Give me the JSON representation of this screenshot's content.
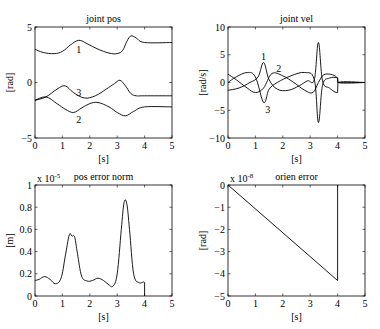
{
  "chart_data": [
    {
      "type": "line",
      "title": "joint pos",
      "xlabel": "[s]",
      "ylabel": "[rad]",
      "xlim": [
        0,
        5
      ],
      "ylim": [
        -5,
        5
      ],
      "xticks": [
        "0",
        "1",
        "2",
        "3",
        "4",
        "5"
      ],
      "yticks": [
        "-5",
        "0",
        "5"
      ],
      "grid": false,
      "series": [
        {
          "name": "1",
          "x": [
            0,
            0.3,
            0.7,
            1.0,
            1.3,
            1.6,
            1.9,
            2.3,
            2.7,
            3.0,
            3.2,
            3.35,
            3.5,
            3.7,
            4.0,
            5.0
          ],
          "y": [
            3.0,
            2.7,
            2.6,
            2.8,
            3.4,
            3.8,
            3.5,
            3.0,
            2.65,
            2.6,
            2.9,
            3.7,
            4.2,
            4.0,
            3.6,
            3.6
          ]
        },
        {
          "name": "2",
          "x": [
            0,
            0.4,
            0.8,
            1.1,
            1.4,
            1.7,
            2.0,
            2.3,
            2.7,
            3.0,
            3.3,
            3.6,
            4.0,
            5.0
          ],
          "y": [
            -1.6,
            -1.3,
            -1.9,
            -2.4,
            -2.7,
            -2.3,
            -1.9,
            -1.8,
            -2.2,
            -2.7,
            -3.0,
            -2.6,
            -2.2,
            -2.2
          ]
        },
        {
          "name": "3",
          "x": [
            0,
            0.4,
            0.8,
            1.1,
            1.4,
            1.8,
            2.2,
            2.6,
            2.9,
            3.1,
            3.3,
            3.5,
            3.7,
            4.0,
            5.0
          ],
          "y": [
            -1.6,
            -1.3,
            -0.6,
            -0.3,
            -0.9,
            -1.4,
            -1.2,
            -0.6,
            -0.1,
            0.2,
            -0.3,
            -1.0,
            -1.2,
            -1.2,
            -1.2
          ]
        }
      ],
      "annotations": [
        {
          "text": "1",
          "x": 1.6,
          "y": 3.0
        },
        {
          "text": "3",
          "x": 1.6,
          "y": -0.9
        },
        {
          "text": "2",
          "x": 1.6,
          "y": -3.3
        }
      ]
    },
    {
      "type": "line",
      "title": "joint vel",
      "xlabel": "[s]",
      "ylabel": "[rad/s]",
      "xlim": [
        0,
        5
      ],
      "ylim": [
        -10,
        10
      ],
      "xticks": [
        "0",
        "1",
        "2",
        "3",
        "4",
        "5"
      ],
      "yticks": [
        "-10",
        "-5",
        "0",
        "5",
        "10"
      ],
      "grid": false,
      "series": [
        {
          "name": "1",
          "x": [
            0,
            0.4,
            0.8,
            1.1,
            1.3,
            1.5,
            1.8,
            2.2,
            2.6,
            2.9,
            3.15,
            3.3,
            3.45,
            3.7,
            4.0,
            4.01,
            5.0
          ],
          "y": [
            -1.4,
            -1.0,
            0,
            1.0,
            3.6,
            0.5,
            -1.2,
            -1.4,
            -0.6,
            0.3,
            0.5,
            7.2,
            0.3,
            -1.0,
            -1.8,
            0,
            0
          ]
        },
        {
          "name": "2",
          "x": [
            0,
            0.3,
            0.7,
            1.0,
            1.3,
            1.6,
            2.0,
            2.4,
            2.8,
            3.1,
            3.3,
            3.5,
            3.8,
            4.0,
            4.01,
            5.0
          ],
          "y": [
            1.5,
            0.5,
            -1.0,
            -1.8,
            -1.0,
            1.6,
            1.2,
            0,
            -1.4,
            -1.8,
            0,
            1.4,
            1.4,
            0.8,
            0,
            0
          ]
        },
        {
          "name": "3",
          "x": [
            0,
            0.3,
            0.7,
            1.0,
            1.3,
            1.5,
            1.8,
            2.3,
            2.8,
            3.15,
            3.3,
            3.45,
            3.7,
            4.0,
            4.01,
            5.0
          ],
          "y": [
            0,
            1.0,
            1.8,
            1.0,
            -3.6,
            -1.2,
            0,
            1.2,
            1.8,
            0.5,
            -7.2,
            -0.5,
            0.8,
            0.8,
            0,
            0
          ]
        }
      ],
      "annotations": [
        {
          "text": "1",
          "x": 1.3,
          "y": 4.6
        },
        {
          "text": "2",
          "x": 1.85,
          "y": 2.5
        },
        {
          "text": "3",
          "x": 1.45,
          "y": -4.8
        }
      ]
    },
    {
      "type": "line",
      "title": "pos error norm",
      "xlabel": "[s]",
      "ylabel": "[m]",
      "exponent_label": "x 10^-5",
      "xlim": [
        0,
        5
      ],
      "ylim": [
        0,
        1
      ],
      "xticks": [
        "0",
        "1",
        "2",
        "3",
        "4",
        "5"
      ],
      "yticks": [
        "0",
        "0.2",
        "0.4",
        "0.6",
        "0.8",
        "1"
      ],
      "grid": false,
      "series": [
        {
          "name": "pos error norm",
          "x": [
            0,
            0.15,
            0.35,
            0.55,
            0.75,
            0.95,
            1.1,
            1.25,
            1.35,
            1.45,
            1.55,
            1.7,
            1.9,
            2.1,
            2.3,
            2.5,
            2.7,
            2.85,
            3.0,
            3.15,
            3.25,
            3.35,
            3.45,
            3.6,
            3.8,
            4.0,
            4.0
          ],
          "y": [
            0.14,
            0.15,
            0.175,
            0.15,
            0.11,
            0.16,
            0.35,
            0.55,
            0.54,
            0.53,
            0.38,
            0.18,
            0.135,
            0.14,
            0.16,
            0.14,
            0.1,
            0.09,
            0.2,
            0.6,
            0.84,
            0.83,
            0.6,
            0.2,
            0.12,
            0.12,
            0
          ]
        }
      ]
    },
    {
      "type": "line",
      "title": "orien error",
      "xlabel": "[s]",
      "ylabel": "[rad]",
      "exponent_label": "x 10^-8",
      "xlim": [
        0,
        5
      ],
      "ylim": [
        -5,
        0
      ],
      "xticks": [
        "0",
        "1",
        "2",
        "3",
        "4",
        "5"
      ],
      "yticks": [
        "-5",
        "-4",
        "-3",
        "-2",
        "-1",
        "0"
      ],
      "grid": false,
      "series": [
        {
          "name": "orien error",
          "x": [
            0,
            4.0,
            4.0
          ],
          "y": [
            0,
            -4.3,
            0
          ]
        }
      ]
    }
  ],
  "plots": {
    "p1": {
      "title": "joint pos",
      "xlabel": "[s]",
      "ylabel": "[rad]"
    },
    "p2": {
      "title": "joint vel",
      "xlabel": "[s]",
      "ylabel": "[rad/s]"
    },
    "p3": {
      "title": "pos error norm",
      "xlabel": "[s]",
      "ylabel": "[m]",
      "exp_base": "x 10",
      "exp": "-5"
    },
    "p4": {
      "title": "orien error",
      "xlabel": "[s]",
      "ylabel": "[rad]",
      "exp_base": "x 10",
      "exp": "-8"
    }
  }
}
